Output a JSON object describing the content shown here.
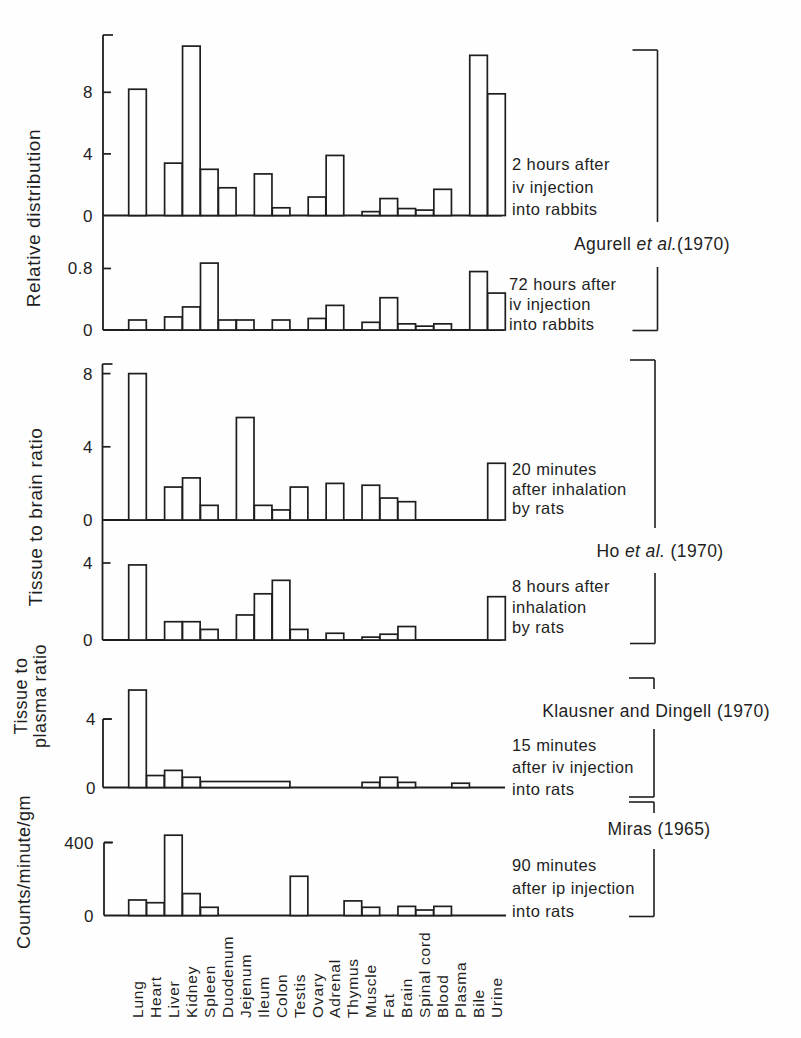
{
  "figure": {
    "ink_color": "#1e1e1e",
    "paper_color": "#fefefe"
  },
  "chart_data": {
    "type": "bar",
    "layout": "6 stacked panels, shared x categories, bars outlined white-filled, grid off",
    "categories": [
      "Lung",
      "Heart",
      "Liver",
      "Kidney",
      "Spleen",
      "Duodenum",
      "Jejenum",
      "Ileum",
      "Colon",
      "Testis",
      "Ovary",
      "Adrenal",
      "Thymus",
      "Muscle",
      "Fat",
      "Brain",
      "Spinal cord",
      "Blood",
      "Plasma",
      "Bile",
      "Urine"
    ],
    "row_labels": [
      "Relative distribution",
      "Tissue to brain ratio",
      "Tissue to",
      "plasma ratio",
      "Counts/minute/gm"
    ],
    "panels": [
      {
        "id": "p1",
        "row_label": "Relative distribution",
        "caption": [
          "2 hours after",
          "iv injection",
          "into rabbits"
        ],
        "study": "Agurell et al.(1970)",
        "yticks": [
          0,
          4,
          8
        ],
        "ylim": [
          0,
          11.5
        ],
        "values": [
          8.2,
          0,
          3.4,
          11,
          3,
          1.8,
          0,
          2.7,
          0.5,
          0,
          1.2,
          3.9,
          0,
          0.25,
          1.1,
          0.45,
          0.35,
          1.7,
          0,
          10.4,
          7.9
        ]
      },
      {
        "id": "p2",
        "row_label": "Relative distribution",
        "caption": [
          "72 hours after",
          "iv injection",
          "into rabbits"
        ],
        "study": "Agurell et al.(1970)",
        "yticks": [
          0,
          0.8
        ],
        "ylim": [
          0,
          1.45
        ],
        "values": [
          0.13,
          0,
          0.17,
          0.3,
          0.87,
          0.13,
          0.13,
          0,
          0.13,
          0,
          0.15,
          0.32,
          0,
          0.1,
          0.42,
          0.08,
          0.05,
          0.08,
          0,
          0.76,
          0.48
        ]
      },
      {
        "id": "p3",
        "row_label": "Tissue to brain ratio",
        "caption": [
          "20 minutes",
          "after inhalation",
          "by rats"
        ],
        "study": "Ho et al. (1970)",
        "yticks": [
          0,
          4,
          8
        ],
        "ylim": [
          0,
          8.6
        ],
        "values": [
          8,
          0,
          1.8,
          2.3,
          0.8,
          0,
          5.6,
          0.8,
          0.55,
          1.8,
          0,
          2,
          0,
          1.9,
          1.2,
          1,
          0,
          0,
          0,
          0,
          3.1
        ]
      },
      {
        "id": "p4",
        "row_label": "Tissue to brain ratio",
        "caption": [
          "8 hours after",
          "inhalation",
          "by rats"
        ],
        "study": "Ho et al. (1970)",
        "yticks": [
          0,
          4
        ],
        "ylim": [
          0,
          6.2
        ],
        "values": [
          3.9,
          0,
          0.95,
          0.95,
          0.55,
          0,
          1.3,
          2.4,
          3.1,
          0.55,
          0,
          0.35,
          0,
          0.15,
          0.3,
          0.7,
          0,
          0,
          0,
          0,
          2.25
        ]
      },
      {
        "id": "p5",
        "row_label": "Tissue to plasma ratio",
        "caption": [
          "15 minutes",
          "after iv injection",
          "into rats"
        ],
        "study": "Klausner and Dingell (1970)",
        "yticks": [
          0,
          4
        ],
        "ylim": [
          0,
          5.9
        ],
        "values": [
          5.7,
          0.7,
          1,
          0.6,
          0.35,
          0.35,
          0.35,
          0.35,
          0.35,
          0,
          0,
          0,
          0,
          0.3,
          0.6,
          0.3,
          0,
          0,
          0.25,
          0,
          0
        ],
        "merged": [
          {
            "from": 4,
            "to": 8,
            "value": 0.35
          }
        ]
      },
      {
        "id": "p6",
        "row_label": "Counts/minute/gm",
        "caption": [
          "90 minutes",
          "after ip injection",
          "into rats"
        ],
        "study": "Miras (1965)",
        "yticks": [
          0,
          400
        ],
        "ylim": [
          0,
          460
        ],
        "values": [
          85,
          70,
          440,
          120,
          45,
          0,
          0,
          0,
          0,
          215,
          0,
          0,
          80,
          45,
          0,
          50,
          30,
          50,
          0,
          0,
          0
        ]
      }
    ],
    "citations": [
      {
        "id": "agurell",
        "segments": [
          {
            "text": "Agurell ",
            "italic": false
          },
          {
            "text": "et al.",
            "italic": true
          },
          {
            "text": "(1970)",
            "italic": false
          }
        ]
      },
      {
        "id": "ho",
        "segments": [
          {
            "text": "Ho ",
            "italic": false
          },
          {
            "text": "et al.",
            "italic": true
          },
          {
            "text": " (1970)",
            "italic": false
          }
        ]
      },
      {
        "id": "klausner",
        "segments": [
          {
            "text": "Klausner and Dingell (1970)",
            "italic": false
          }
        ]
      },
      {
        "id": "miras",
        "segments": [
          {
            "text": "Miras (1965)",
            "italic": false
          }
        ]
      }
    ]
  }
}
